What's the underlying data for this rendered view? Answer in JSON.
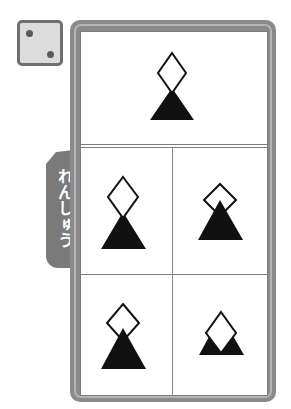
{
  "die": {
    "icon": "die-face-two-icon",
    "face_value": 2
  },
  "side_tab": {
    "label": "れんしゅう"
  },
  "colors": {
    "frame": "#8a8a8a",
    "frame_stripe": "#b4b4b4",
    "tab": "#7a7a7a",
    "shape_fill_dark": "#111111",
    "shape_fill_light": "#ffffff"
  },
  "puzzle": {
    "prompt_cell": {
      "shapes": [
        {
          "type": "triangle",
          "fill": "black",
          "layer": "back"
        },
        {
          "type": "diamond",
          "fill": "white",
          "layer": "front"
        }
      ]
    },
    "options": [
      {
        "position": "middle-left",
        "front": "diamond",
        "back": "triangle"
      },
      {
        "position": "middle-right",
        "front": "triangle",
        "back": "diamond"
      },
      {
        "position": "bottom-left",
        "front": "triangle",
        "back": "diamond"
      },
      {
        "position": "bottom-right",
        "front": "diamond",
        "back": "triangle"
      }
    ]
  }
}
